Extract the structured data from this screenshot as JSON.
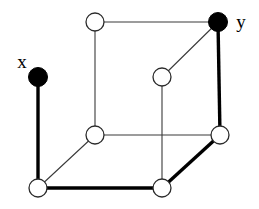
{
  "figure": {
    "width": 259,
    "height": 209,
    "background_color": "#ffffff",
    "thin_edge_color": "#3a3a3a",
    "thick_edge_color": "#000000",
    "open_node_fill": "#ffffff",
    "filled_node_fill": "#000000"
  },
  "labels": {
    "source": "x",
    "target": "y"
  },
  "chart_data": {
    "type": "diagram",
    "graph_type": "cube-graph",
    "nodes": [
      {
        "id": "top_left",
        "label": "",
        "x": 95,
        "y": 22,
        "style": "open",
        "radius": 9
      },
      {
        "id": "top_right",
        "label": "y",
        "x": 218,
        "y": 22,
        "style": "filled",
        "radius": 9.5
      },
      {
        "id": "left_upper",
        "label": "x",
        "x": 38,
        "y": 77,
        "style": "filled",
        "radius": 9.5
      },
      {
        "id": "center_inner",
        "label": "",
        "x": 162,
        "y": 77,
        "style": "open",
        "radius": 9
      },
      {
        "id": "mid_left",
        "label": "",
        "x": 95,
        "y": 135,
        "style": "open",
        "radius": 9
      },
      {
        "id": "mid_right",
        "label": "",
        "x": 220,
        "y": 135,
        "style": "open",
        "radius": 9
      },
      {
        "id": "bottom_left",
        "label": "",
        "x": 38,
        "y": 188,
        "style": "open",
        "radius": 9
      },
      {
        "id": "bottom_right",
        "label": "",
        "x": 162,
        "y": 188,
        "style": "open",
        "radius": 9
      }
    ],
    "edges": [
      {
        "from": "left_upper",
        "to": "bottom_left",
        "weight": "thick"
      },
      {
        "from": "bottom_left",
        "to": "bottom_right",
        "weight": "thick"
      },
      {
        "from": "bottom_right",
        "to": "mid_right",
        "weight": "thick"
      },
      {
        "from": "mid_right",
        "to": "top_right",
        "weight": "thick"
      },
      {
        "from": "top_left",
        "to": "top_right",
        "weight": "thin"
      },
      {
        "from": "top_left",
        "to": "mid_left",
        "weight": "thin"
      },
      {
        "from": "center_inner",
        "to": "top_right",
        "weight": "thin"
      },
      {
        "from": "center_inner",
        "to": "bottom_right",
        "weight": "thin"
      },
      {
        "from": "mid_left",
        "to": "mid_right",
        "weight": "thin"
      },
      {
        "from": "mid_left",
        "to": "bottom_left",
        "weight": "thin"
      }
    ],
    "highlighted_path": [
      "left_upper",
      "bottom_left",
      "bottom_right",
      "mid_right",
      "top_right"
    ],
    "node_count": 8,
    "edge_count": 10
  },
  "label_positions": {
    "x": {
      "x": 22,
      "y": 68
    },
    "y": {
      "x": 241,
      "y": 28
    }
  }
}
